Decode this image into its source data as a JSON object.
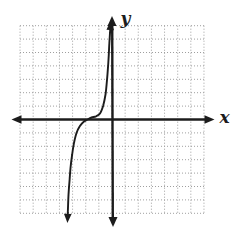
{
  "figure": {
    "background": "#ffffff",
    "axis_color": "#1c1c1c",
    "grid_color": "#9e9e9e",
    "curve_color": "#1c1c1c"
  },
  "chart_data": {
    "type": "line",
    "title": "",
    "xlabel": "x",
    "ylabel": "y",
    "xlim": [
      -7,
      7
    ],
    "ylim": [
      -7,
      7
    ],
    "grid": true,
    "grid_style": "dotted",
    "legend": false,
    "x_intercept": -1.9,
    "series": [
      {
        "name": "cubic-curve",
        "color": "#1c1c1c",
        "arrow_ends": true,
        "points": [
          [
            -3.36,
            -6.9
          ],
          [
            -3.31,
            -5.63
          ],
          [
            -3.23,
            -4.51
          ],
          [
            -3.16,
            -3.62
          ],
          [
            -3.04,
            -2.65
          ],
          [
            -2.89,
            -1.75
          ],
          [
            -2.7,
            -1.01
          ],
          [
            -2.44,
            -0.49
          ],
          [
            -2.13,
            -0.15
          ],
          [
            -1.86,
            0.0
          ],
          [
            -1.56,
            0.15
          ],
          [
            -1.22,
            0.24
          ],
          [
            -0.91,
            0.45
          ],
          [
            -0.68,
            1.01
          ],
          [
            -0.49,
            1.9
          ],
          [
            -0.38,
            2.95
          ],
          [
            -0.28,
            4.22
          ],
          [
            -0.21,
            5.49
          ],
          [
            -0.15,
            6.46
          ]
        ]
      }
    ]
  }
}
